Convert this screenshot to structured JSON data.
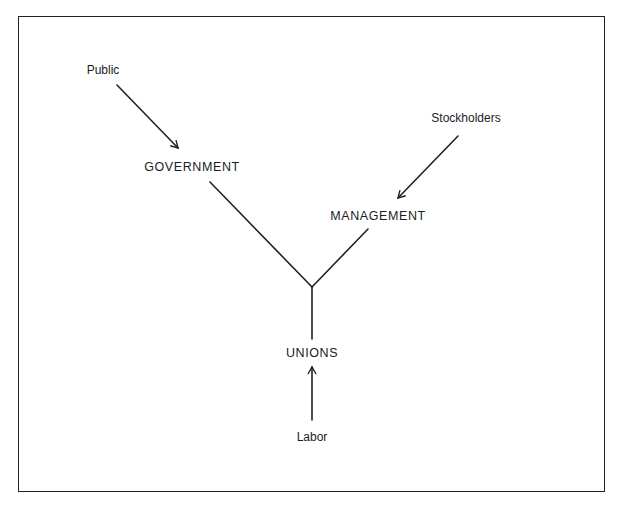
{
  "diagram": {
    "type": "influence-diagram",
    "nodes": {
      "public": {
        "label": "Public",
        "x": 103,
        "y": 70,
        "style": "small"
      },
      "government": {
        "label": "GOVERNMENT",
        "x": 192,
        "y": 167,
        "style": "caps"
      },
      "stockholders": {
        "label": "Stockholders",
        "x": 466,
        "y": 118,
        "style": "small"
      },
      "management": {
        "label": "MANAGEMENT",
        "x": 378,
        "y": 216,
        "style": "caps"
      },
      "unions": {
        "label": "UNIONS",
        "x": 312,
        "y": 353,
        "style": "caps"
      },
      "labor": {
        "label": "Labor",
        "x": 312,
        "y": 437,
        "style": "small"
      }
    },
    "edges": [
      {
        "from": "Public",
        "to": "GOVERNMENT",
        "kind": "arrow",
        "x1": 117,
        "y1": 85,
        "x2": 178,
        "y2": 148
      },
      {
        "from": "Stockholders",
        "to": "MANAGEMENT",
        "kind": "arrow",
        "x1": 458,
        "y1": 136,
        "x2": 398,
        "y2": 198
      },
      {
        "from": "Labor",
        "to": "UNIONS",
        "kind": "arrow",
        "x1": 312,
        "y1": 420,
        "x2": 312,
        "y2": 367
      },
      {
        "from": "GOVERNMENT",
        "to": "junction",
        "kind": "line",
        "x1": 210,
        "y1": 182,
        "x2": 312,
        "y2": 287
      },
      {
        "from": "MANAGEMENT",
        "to": "junction",
        "kind": "line",
        "x1": 368,
        "y1": 229,
        "x2": 312,
        "y2": 287
      },
      {
        "from": "junction",
        "to": "UNIONS",
        "kind": "line",
        "x1": 312,
        "y1": 287,
        "x2": 312,
        "y2": 339
      }
    ],
    "junction": {
      "x": 312,
      "y": 287
    },
    "colors": {
      "stroke": "#222222",
      "text": "#1c1c1c",
      "background": "#ffffff"
    }
  }
}
